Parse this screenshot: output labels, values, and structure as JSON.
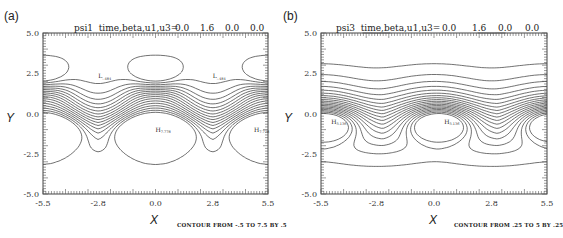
{
  "chart_data": [
    {
      "type": "contour",
      "panel_label": "(a)",
      "title_prefix": "psi1  time,beta,u1,u3=",
      "params": {
        "time": "0.0",
        "beta": "1.6",
        "u1": "0.0",
        "u3": "0.0"
      },
      "xlabel": "X",
      "ylabel": "Y",
      "xlim": [
        -5.5,
        5.5
      ],
      "ylim": [
        -5.0,
        5.0
      ],
      "xticks": [
        "-5.5",
        "-2.8",
        "0.0",
        "2.8",
        "5.5"
      ],
      "yticks": [
        "5.0",
        "2.5",
        "0.0",
        "-2.5",
        "-5.0"
      ],
      "contour_info": "CONTOUR FROM -.5 TO 7.5 BY .5",
      "contour_range": {
        "from": -0.5,
        "to": 7.5,
        "step": 0.5
      },
      "extrema": [
        {
          "type": "L",
          "value": "-.484",
          "x": -2.8,
          "y": 2.3
        },
        {
          "type": "L",
          "value": "-.484",
          "x": 2.8,
          "y": 2.3
        },
        {
          "type": "H",
          "value": "7.778",
          "x": 0.0,
          "y": -1.0
        },
        {
          "type": "H",
          "value": "7.778",
          "x": 5.5,
          "y": -1.0
        }
      ],
      "sample_contour_labels": [
        "0",
        "1.5",
        "2.5",
        "3.5",
        "4.5",
        "5.5",
        "6.5"
      ]
    },
    {
      "type": "contour",
      "panel_label": "(b)",
      "title_prefix": "psi3  time,beta,u1,u3=",
      "params": {
        "time": "0.0",
        "beta": "1.6",
        "u1": "0.0",
        "u3": "0.0"
      },
      "xlabel": "X",
      "ylabel": "Y",
      "xlim": [
        -5.5,
        5.5
      ],
      "ylim": [
        -5.0,
        5.0
      ],
      "xticks": [
        "-5.5",
        "-2.8",
        "0.0",
        "2.8",
        "5.5"
      ],
      "yticks": [
        "5.0",
        "2.5",
        "0.0",
        "-2.5",
        "-5.0"
      ],
      "contour_info": "CONTOUR FROM .25 TO 5 BY .25",
      "contour_range": {
        "from": 0.25,
        "to": 5.0,
        "step": 0.25
      },
      "extrema": [
        {
          "type": "H",
          "value": "5.136",
          "x": -5.0,
          "y": -0.5
        },
        {
          "type": "H",
          "value": "5.136",
          "x": 0.5,
          "y": -0.5
        }
      ],
      "sample_contour_labels": [
        ".25",
        ".75",
        "1.25",
        "1.75",
        "2.25",
        "2.75",
        "3.25",
        "3.75",
        "4.25",
        "4.75"
      ]
    }
  ]
}
